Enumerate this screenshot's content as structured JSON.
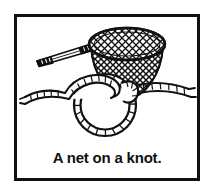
{
  "card": {
    "caption": "A net on a knot.",
    "frame_color": "#111111",
    "background_color": "#ffffff",
    "ink_color": "#111111"
  },
  "illustration": {
    "title": "net-on-knot-line-drawing",
    "objects": [
      {
        "name": "fishing-net",
        "parts": [
          "handle-shaft",
          "handle-grip-ferrule",
          "hoop-ellipse",
          "mesh-crosshatch",
          "net-bag-cone"
        ]
      },
      {
        "name": "rope-knot",
        "parts": [
          "loop-ring",
          "crossing-overhand",
          "left-rope-tail",
          "right-rope-tail",
          "rope-hatch-texture"
        ]
      }
    ]
  }
}
